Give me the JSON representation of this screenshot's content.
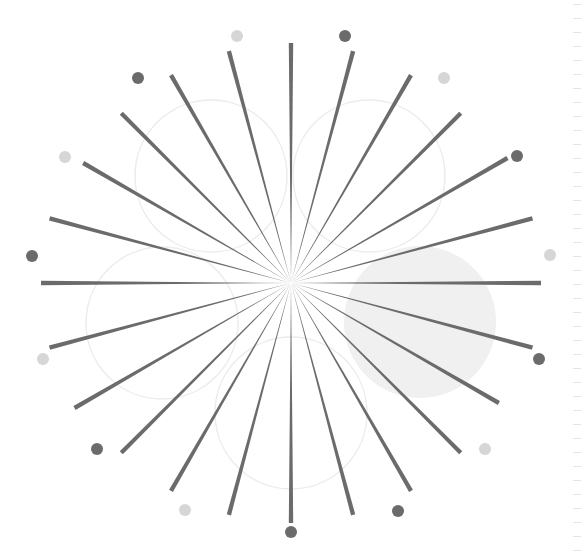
{
  "center": {
    "x": 291,
    "y": 283
  },
  "spokes": {
    "count": 24,
    "step_deg": 15,
    "color": "#6b6b6b",
    "lengths": [
      240,
      240,
      240,
      240,
      250,
      250,
      250,
      250,
      240,
      240,
      240,
      240,
      240,
      240,
      240,
      240,
      250,
      250,
      250,
      250,
      240,
      240,
      240,
      240
    ]
  },
  "dots": [
    {
      "x": 237,
      "y": 36,
      "tone": "light"
    },
    {
      "x": 345,
      "y": 36,
      "tone": "dark"
    },
    {
      "x": 444,
      "y": 78,
      "tone": "light"
    },
    {
      "x": 517,
      "y": 156,
      "tone": "dark"
    },
    {
      "x": 550,
      "y": 255,
      "tone": "light"
    },
    {
      "x": 539,
      "y": 359,
      "tone": "dark"
    },
    {
      "x": 485,
      "y": 449,
      "tone": "light"
    },
    {
      "x": 398,
      "y": 511,
      "tone": "dark"
    },
    {
      "x": 291,
      "y": 532,
      "tone": "dark"
    },
    {
      "x": 185,
      "y": 510,
      "tone": "light"
    },
    {
      "x": 97,
      "y": 449,
      "tone": "dark"
    },
    {
      "x": 43,
      "y": 359,
      "tone": "light"
    },
    {
      "x": 32,
      "y": 256,
      "tone": "dark"
    },
    {
      "x": 65,
      "y": 157,
      "tone": "light"
    },
    {
      "x": 138,
      "y": 78,
      "tone": "dark"
    }
  ],
  "circles": [
    {
      "cx": 211,
      "cy": 176,
      "r": 76,
      "fill": "none"
    },
    {
      "cx": 369,
      "cy": 176,
      "r": 76,
      "fill": "none"
    },
    {
      "cx": 162,
      "cy": 323,
      "r": 76,
      "fill": "none"
    },
    {
      "cx": 291,
      "cy": 413,
      "r": 76,
      "fill": "none"
    },
    {
      "cx": 420,
      "cy": 322,
      "r": 76,
      "fill": "#f0f0f0"
    }
  ],
  "colors": {
    "dark": "#6b6b6b",
    "light": "#d6d6d6",
    "circle_stroke": "#ececec"
  },
  "ruler": {
    "tick_count": 40,
    "spacing": 14
  }
}
